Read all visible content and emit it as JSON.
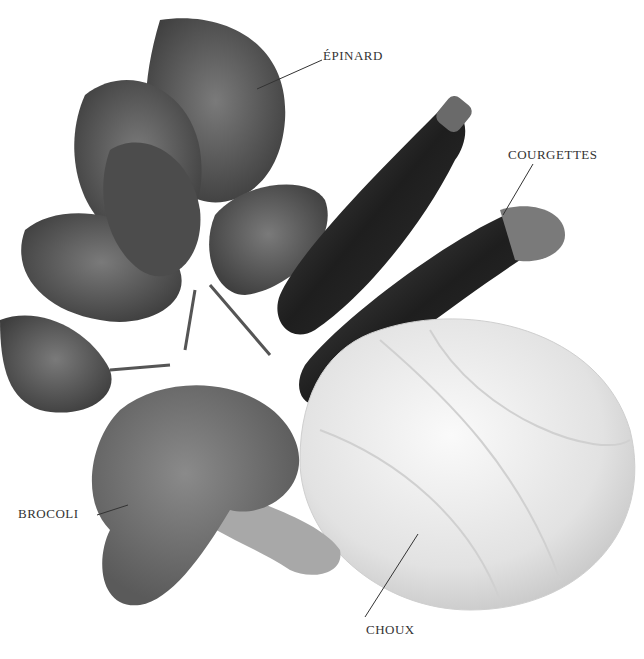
{
  "labels": {
    "spinach": "ÉPINARD",
    "zucchini": "COURGETTES",
    "broccoli": "BROCOLI",
    "cabbage": "CHOUX"
  },
  "colors": {
    "spinach": "#5a5a5a",
    "zucchini": "#2a2a2a",
    "broccoli": "#6e6e6e",
    "cabbage": "#e6e6e6",
    "text": "#333333"
  }
}
